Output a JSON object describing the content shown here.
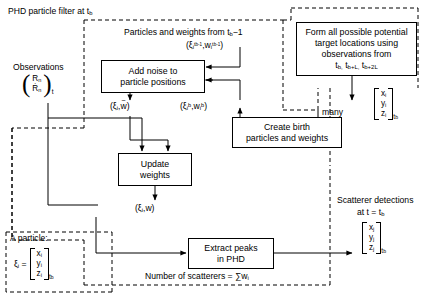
{
  "diagram": {
    "type": "flowchart",
    "groups": {
      "phd_filter_region": "PHD particle filter at t_b",
      "birth_region": "potential-target-location region"
    },
    "labels": {
      "particles_weights_from": "Particles and weights from t",
      "particles_weights_from_sub": "b",
      "particles_weights_from_tail": "−1",
      "prior_particles": "(ξ",
      "observations": "Observations",
      "many": "many",
      "scatterer_detections_l1": "Scatterer detections",
      "scatterer_detections_l2": "at t = t",
      "scatterer_detections_l2_sub": "b",
      "a_particle": "A particle:",
      "number_of_scatterers": "Number of scatterers = ∑w",
      "number_of_scatterers_sub": "i"
    },
    "boxes": [
      {
        "id": "add-noise",
        "line1": "Add noise to",
        "line2": "particle positions"
      },
      {
        "id": "form-locations",
        "line1": "Form all possible potential",
        "line2": "target locations using",
        "line3": "observations from",
        "line4_times": [
          "t",
          "t",
          "t"
        ],
        "line4_subs": [
          "b,",
          "b+L,",
          "b+2L"
        ]
      },
      {
        "id": "create-birth",
        "line1": "Create birth",
        "line2": "particles and weights"
      },
      {
        "id": "update-weights",
        "line1": "Update",
        "line2": "weights"
      },
      {
        "id": "extract-peaks",
        "line1": "Extract peaks",
        "line2": "in PHD"
      }
    ],
    "edge_labels": {
      "prior": {
        "xi": "ξ",
        "xi_sub": "i",
        "xi_sup": "t",
        "xi_sup_sub": "b−1",
        "w": "w",
        "w_sub": "i",
        "w_sup": "t",
        "w_sup_sub": "b−1"
      },
      "noised": {
        "xi": "ξ",
        "xi_sub": "i",
        "w": "w",
        "w_accent": "~"
      },
      "birth": {
        "xi": "ξ",
        "xi_sub": "i",
        "xi_sup": "b",
        "w": "w",
        "w_sub": "i",
        "w_sup": "b"
      },
      "updated": {
        "xi": "ξ",
        "xi_sub": "i",
        "w": "w"
      }
    },
    "vectors": {
      "observations": {
        "rows": [
          "R",
          "Ṙ"
        ],
        "row_subs": [
          "n",
          "n"
        ],
        "time_sub": "t"
      },
      "potential_locations": {
        "rows": [
          "x",
          "y",
          "z"
        ],
        "row_subs": [
          "i",
          "i",
          "i"
        ],
        "time": "t",
        "time_sub": "b"
      },
      "particle_definition": {
        "lhs": "ξ",
        "lhs_sub": "i",
        "eq": "=",
        "rows": [
          "x",
          "y",
          "z"
        ],
        "row_subs": [
          "i",
          "i",
          "i"
        ],
        "time": "t",
        "time_sub": "b"
      },
      "detections": {
        "rows": [
          "x",
          "y",
          "z"
        ],
        "row_subs": [
          "j",
          "j",
          "j"
        ],
        "time": "t",
        "time_sub": "b"
      }
    },
    "colors": {
      "stroke": "#000000",
      "background": "#ffffff"
    }
  }
}
